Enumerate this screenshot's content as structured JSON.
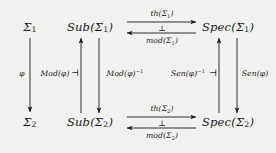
{
  "diagram": {
    "background_color": "#f2f1ef",
    "ink_color": "#1a1a1a",
    "nodes": [
      {
        "id": "sigma1",
        "text": "Σ₁",
        "x": 30,
        "y": 27
      },
      {
        "id": "sub_sigma1",
        "text": "Sub(Σ₁)",
        "x": 90,
        "y": 27
      },
      {
        "id": "spec_sigma1",
        "text": "Spec(Σ₁)",
        "x": 228,
        "y": 27
      },
      {
        "id": "sigma2",
        "text": "Σ₂",
        "x": 30,
        "y": 122
      },
      {
        "id": "sub_sigma2",
        "text": "Sub(Σ₂)",
        "x": 90,
        "y": 122
      },
      {
        "id": "spec_sigma2",
        "text": "Spec(Σ₂)",
        "x": 228,
        "y": 122
      }
    ],
    "edge_labels": {
      "th_top": "th(Σ₁)",
      "mod_top": "mod(Σ₁)",
      "th_bottom": "th(Σ₂)",
      "mod_bottom": "mod(Σ₂)",
      "phi": "ϕ",
      "mod_phi": "Mod(ϕ)",
      "mod_phi_inv": "Mod(ϕ)⁻¹",
      "sen_phi_inv": "Sen(ϕ)⁻¹",
      "sen_phi": "Sen(ϕ)",
      "perp_top": "⊥",
      "perp_bottom": "⊥",
      "adjoint_left": "⊣",
      "adjoint_right": "⊣"
    }
  }
}
